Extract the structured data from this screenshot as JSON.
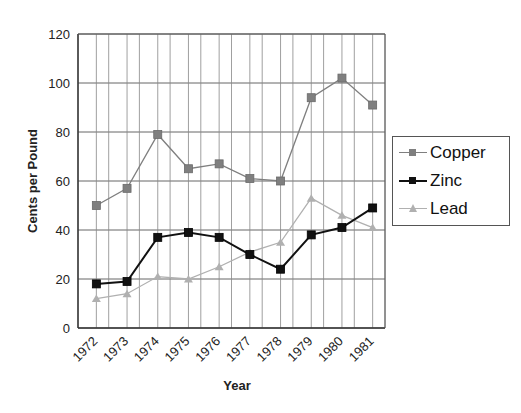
{
  "chart_data": {
    "type": "line",
    "title": "",
    "xlabel": "Year",
    "ylabel": "Cents per Pound",
    "x": [
      "1972",
      "1973",
      "1974",
      "1975",
      "1976",
      "1977",
      "1978",
      "1979",
      "1980",
      "1981"
    ],
    "ylim": [
      0,
      120
    ],
    "yticks": [
      0,
      20,
      40,
      60,
      80,
      100,
      120
    ],
    "grid": true,
    "legend_position": "right",
    "series": [
      {
        "name": "Copper",
        "color": "#7f7f7f",
        "marker": "square",
        "values": [
          50,
          57,
          79,
          65,
          67,
          61,
          60,
          94,
          102,
          91
        ]
      },
      {
        "name": "Zinc",
        "color": "#111111",
        "marker": "square",
        "values": [
          18,
          19,
          37,
          39,
          37,
          30,
          24,
          38,
          41,
          49
        ]
      },
      {
        "name": "Lead",
        "color": "#b0b0b0",
        "marker": "triangle",
        "values": [
          12,
          14,
          21,
          20,
          25,
          31,
          35,
          53,
          46,
          41
        ]
      }
    ]
  },
  "legend": {
    "items": [
      {
        "label": "Copper"
      },
      {
        "label": "Zinc"
      },
      {
        "label": "Lead"
      }
    ]
  }
}
